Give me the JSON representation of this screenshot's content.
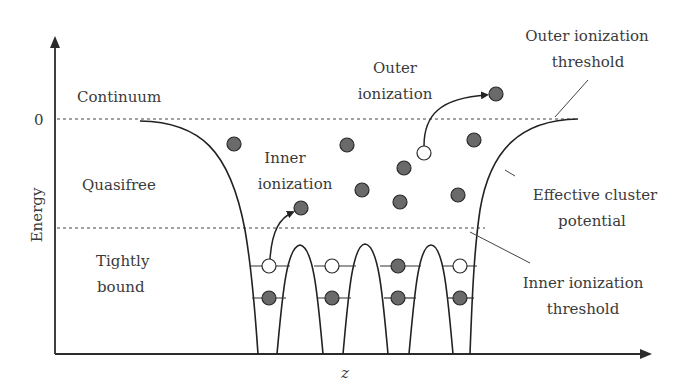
{
  "axes": {
    "y_label": "Energy",
    "x_label": "z",
    "zero_tick": "0"
  },
  "regions": {
    "continuum": "Continuum",
    "quasifree": "Quasifree",
    "tightly_bound_line1": "Tightly",
    "tightly_bound_line2": "bound"
  },
  "annotations": {
    "inner_ionization_line1": "Inner",
    "inner_ionization_line2": "ionization",
    "outer_ionization_line1": "Outer",
    "outer_ionization_line2": "ionization",
    "outer_threshold_line1": "Outer ionization",
    "outer_threshold_line2": "threshold",
    "effective_potential_line1": "Effective cluster",
    "effective_potential_line2": "potential",
    "inner_threshold_line1": "Inner ionization",
    "inner_threshold_line2": "threshold"
  },
  "colors": {
    "filled_electron": "#6a6a6a",
    "empty_state": "#ffffff",
    "line": "#222222"
  },
  "particles": {
    "quasifree_filled": 9,
    "continuum_filled": 1,
    "bound_empty": 4,
    "bound_filled": 4
  }
}
